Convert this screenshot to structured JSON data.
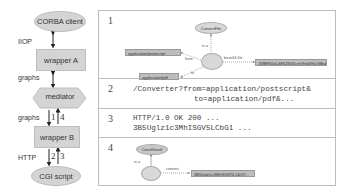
{
  "flow": {
    "nodes": {
      "corba_client": "CORBA client",
      "wrapper_a": "wrapper A",
      "mediator": "mediator",
      "wrapper_b": "wrapper B",
      "cgi_script": "CGI script"
    },
    "edge_labels": {
      "iiop": "IIOP",
      "graphs_1": "graphs",
      "graphs_2": "graphs",
      "http": "HTTP"
    },
    "step_numbers": {
      "s1": "1",
      "s4": "4",
      "s2": "2",
      "s3": "3"
    }
  },
  "table": {
    "rows": [
      {
        "num": "1",
        "graph": {
          "top_node": "ConvertFile",
          "isa": "is-a",
          "from_edge": "from",
          "to_edge": "to",
          "base64_edge": "base64 file",
          "from_value": "application/postscript",
          "to_value": "application/pdf",
          "base64_value": "JVBERi0xLjMKJSVDcmVhdG9yOiBkdmlwcyA1..."
        }
      },
      {
        "num": "2",
        "line1": "/Converter?from=application/postscript&",
        "line2": "to=application/pdf&..."
      },
      {
        "num": "3",
        "line1": "HTTP/1.0 OK 200 ...",
        "line2": "3B5Uglz1c3MhISGV5LCbG1 ..."
      },
      {
        "num": "4",
        "graph": {
          "top_node": "ConvResult",
          "isa": "is-a",
          "content_edge": "content",
          "content_value": "3B5Uglz1c3MhISGV5LCbG7..."
        }
      }
    ]
  }
}
